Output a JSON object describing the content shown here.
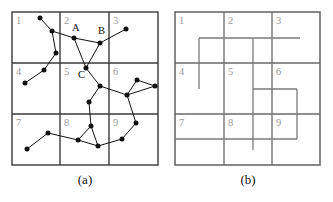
{
  "figure": {
    "panels": [
      {
        "id": "a",
        "caption": "(a)",
        "type": "graph-over-grid",
        "grid": {
          "rows": 3,
          "cols": 3,
          "x0": 12,
          "y0": 12,
          "x1": 158,
          "y1": 165,
          "cell_labels": [
            "1",
            "2",
            "3",
            "4",
            "5",
            "6",
            "7",
            "8",
            "9"
          ],
          "v_lines_x": [
            60,
            109
          ],
          "h_lines_y": [
            63,
            114
          ]
        },
        "point_labels": [
          {
            "text": "A",
            "x": 72,
            "y": 31
          },
          {
            "text": "B",
            "x": 98,
            "y": 34
          },
          {
            "text": "C",
            "x": 78,
            "y": 78
          }
        ],
        "nodes": [
          {
            "id": "n1",
            "x": 40,
            "y": 18
          },
          {
            "id": "n2",
            "x": 52,
            "y": 31
          },
          {
            "id": "n3",
            "x": 56,
            "y": 53
          },
          {
            "id": "n4",
            "x": 44,
            "y": 70
          },
          {
            "id": "n5",
            "x": 25,
            "y": 83
          },
          {
            "id": "A",
            "x": 74,
            "y": 38
          },
          {
            "id": "B",
            "x": 100,
            "y": 43
          },
          {
            "id": "n8",
            "x": 126,
            "y": 29
          },
          {
            "id": "C",
            "x": 86,
            "y": 68
          },
          {
            "id": "n10",
            "x": 100,
            "y": 86
          },
          {
            "id": "n11",
            "x": 89,
            "y": 102
          },
          {
            "id": "n12",
            "x": 127,
            "y": 95
          },
          {
            "id": "n13",
            "x": 137,
            "y": 80
          },
          {
            "id": "n14",
            "x": 155,
            "y": 86
          },
          {
            "id": "n15",
            "x": 91,
            "y": 126
          },
          {
            "id": "n16",
            "x": 78,
            "y": 140
          },
          {
            "id": "n17",
            "x": 98,
            "y": 146
          },
          {
            "id": "n18",
            "x": 48,
            "y": 133
          },
          {
            "id": "n19",
            "x": 27,
            "y": 149
          },
          {
            "id": "n20",
            "x": 122,
            "y": 139
          },
          {
            "id": "n21",
            "x": 136,
            "y": 123
          }
        ],
        "edges": [
          [
            "n1",
            "n2"
          ],
          [
            "n2",
            "n3"
          ],
          [
            "n3",
            "n4"
          ],
          [
            "n4",
            "n5"
          ],
          [
            "n2",
            "A"
          ],
          [
            "A",
            "B"
          ],
          [
            "B",
            "n8"
          ],
          [
            "A",
            "C"
          ],
          [
            "B",
            "C"
          ],
          [
            "C",
            "n10"
          ],
          [
            "n10",
            "n11"
          ],
          [
            "n10",
            "n12"
          ],
          [
            "n12",
            "n13"
          ],
          [
            "n13",
            "n14"
          ],
          [
            "n12",
            "n14"
          ],
          [
            "n11",
            "n15"
          ],
          [
            "n15",
            "n16"
          ],
          [
            "n15",
            "n17"
          ],
          [
            "n16",
            "n17"
          ],
          [
            "n16",
            "n18"
          ],
          [
            "n18",
            "n19"
          ],
          [
            "n17",
            "n20"
          ],
          [
            "n20",
            "n21"
          ],
          [
            "n21",
            "n12"
          ]
        ]
      },
      {
        "id": "b",
        "caption": "(b)",
        "type": "grid-with-walls",
        "grid": {
          "rows": 3,
          "cols": 3,
          "x0": 175,
          "y0": 12,
          "x1": 320,
          "y1": 165,
          "cell_labels": [
            "1",
            "2",
            "3",
            "4",
            "5",
            "6",
            "7",
            "8",
            "9"
          ],
          "v_lines_x": [
            224,
            272
          ],
          "h_lines_y": [
            63,
            114
          ]
        },
        "walls": [
          {
            "name": "top-horizontal-run",
            "x1": 199,
            "y1": 38,
            "x2": 300,
            "y2": 38
          },
          {
            "name": "left-vertical-drop",
            "x1": 199,
            "y1": 38,
            "x2": 199,
            "y2": 89
          },
          {
            "name": "mid-vertical-long",
            "x1": 253,
            "y1": 38,
            "x2": 253,
            "y2": 150
          },
          {
            "name": "box-top",
            "x1": 253,
            "y1": 89,
            "x2": 297,
            "y2": 89
          },
          {
            "name": "box-right",
            "x1": 297,
            "y1": 89,
            "x2": 297,
            "y2": 139
          },
          {
            "name": "box-bottom",
            "x1": 208,
            "y1": 139,
            "x2": 297,
            "y2": 139
          },
          {
            "name": "lower-left-run",
            "x1": 175,
            "y1": 139,
            "x2": 208,
            "y2": 139
          }
        ]
      }
    ]
  }
}
